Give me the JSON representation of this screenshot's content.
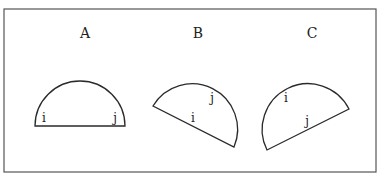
{
  "diagram": {
    "panels": [
      {
        "id": "A",
        "title": "A",
        "points": [
          {
            "name": "i",
            "label": "i"
          },
          {
            "name": "j",
            "label": "j"
          }
        ],
        "description": "Semicircle resting on its flat diameter; i at left end, j at right end"
      },
      {
        "id": "B",
        "title": "B",
        "points": [
          {
            "name": "i",
            "label": "i"
          },
          {
            "name": "j",
            "label": "j"
          }
        ],
        "description": "Semicircle tilted clockwise; i near middle of chord, j inside upper arc"
      },
      {
        "id": "C",
        "title": "C",
        "points": [
          {
            "name": "i",
            "label": "i"
          },
          {
            "name": "j",
            "label": "j"
          }
        ],
        "description": "Semicircle tilted counter-clockwise; i inside upper arc, j near middle of chord"
      }
    ],
    "colors": {
      "stroke": "#2a2a2a",
      "frame": "#555555",
      "background": "#ffffff"
    }
  }
}
